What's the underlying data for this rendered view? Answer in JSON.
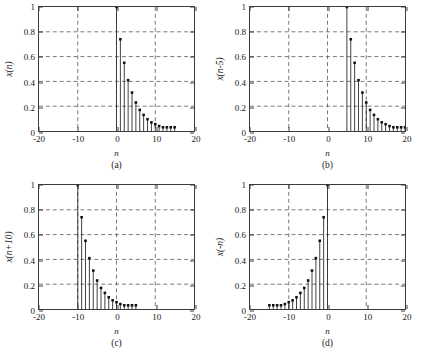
{
  "figure": {
    "title": "",
    "xlabel": "n",
    "xticks": [
      "-20",
      "-10",
      "0",
      "10",
      "20"
    ],
    "xtick_values": [
      -20,
      -10,
      0,
      10,
      20
    ],
    "yticks": [
      "0",
      "0.2",
      "0.4",
      "0.6",
      "0.8",
      "1"
    ],
    "ytick_values": [
      0,
      0.2,
      0.4,
      0.6,
      0.8,
      1
    ],
    "xlim": [
      -20,
      20
    ],
    "ylim": [
      0,
      1
    ],
    "gridlines_x": [
      -10,
      0,
      10
    ],
    "gridlines_y": [
      0.2,
      0.4,
      0.6,
      0.8
    ],
    "grid_style": "dashed",
    "colors": {
      "stem": "#2a2a2a",
      "marker": "#111111",
      "axis": "#3c3c3c",
      "grid": "#555555",
      "background": "#ffffff"
    }
  },
  "panels": [
    {
      "id": "a",
      "caption": "(a)",
      "ylabel": "x(n)",
      "xlabel": "n"
    },
    {
      "id": "b",
      "caption": "(b)",
      "ylabel": "x(n-5)",
      "xlabel": "n"
    },
    {
      "id": "c",
      "caption": "(c)",
      "ylabel": "x(n+10)",
      "xlabel": "n"
    },
    {
      "id": "d",
      "caption": "(d)",
      "ylabel": "x(-n)",
      "xlabel": "n"
    }
  ],
  "chart_data": [
    {
      "type": "scatter",
      "subtype": "stem",
      "title": "x(n)",
      "panel": "a",
      "xlabel": "n",
      "ylabel": "x(n)",
      "xlim": [
        -20,
        20
      ],
      "ylim": [
        0,
        1
      ],
      "grid": true,
      "x": [
        0,
        1,
        2,
        3,
        4,
        5,
        6,
        7,
        8,
        9,
        10,
        11,
        12,
        13,
        14,
        15
      ],
      "y": [
        1,
        0.74,
        0.55,
        0.41,
        0.31,
        0.23,
        0.17,
        0.13,
        0.095,
        0.07,
        0.055,
        0.04,
        0.03,
        0.03,
        0.03,
        0.03
      ]
    },
    {
      "type": "scatter",
      "subtype": "stem",
      "title": "x(n-5)",
      "panel": "b",
      "xlabel": "n",
      "ylabel": "x(n-5)",
      "xlim": [
        -20,
        20
      ],
      "ylim": [
        0,
        1
      ],
      "grid": true,
      "x": [
        5,
        6,
        7,
        8,
        9,
        10,
        11,
        12,
        13,
        14,
        15,
        16,
        17,
        18,
        19,
        20
      ],
      "y": [
        1,
        0.74,
        0.55,
        0.41,
        0.31,
        0.23,
        0.17,
        0.13,
        0.095,
        0.07,
        0.055,
        0.04,
        0.03,
        0.03,
        0.03,
        0.03
      ]
    },
    {
      "type": "scatter",
      "subtype": "stem",
      "title": "x(n+10)",
      "panel": "c",
      "xlabel": "n",
      "ylabel": "x(n+10)",
      "xlim": [
        -20,
        20
      ],
      "ylim": [
        0,
        1
      ],
      "grid": true,
      "x": [
        -10,
        -9,
        -8,
        -7,
        -6,
        -5,
        -4,
        -3,
        -2,
        -1,
        0,
        1,
        2,
        3,
        4,
        5
      ],
      "y": [
        1,
        0.74,
        0.55,
        0.41,
        0.31,
        0.23,
        0.17,
        0.13,
        0.095,
        0.07,
        0.055,
        0.04,
        0.03,
        0.03,
        0.03,
        0.03
      ]
    },
    {
      "type": "scatter",
      "subtype": "stem",
      "title": "x(-n)",
      "panel": "d",
      "xlabel": "n",
      "ylabel": "x(-n)",
      "xlim": [
        -20,
        20
      ],
      "ylim": [
        0,
        1
      ],
      "grid": true,
      "x": [
        -15,
        -14,
        -13,
        -12,
        -11,
        -10,
        -9,
        -8,
        -7,
        -6,
        -5,
        -4,
        -3,
        -2,
        -1,
        0
      ],
      "y": [
        0.03,
        0.03,
        0.03,
        0.03,
        0.04,
        0.055,
        0.07,
        0.095,
        0.13,
        0.17,
        0.23,
        0.31,
        0.41,
        0.55,
        0.74,
        1
      ]
    }
  ]
}
